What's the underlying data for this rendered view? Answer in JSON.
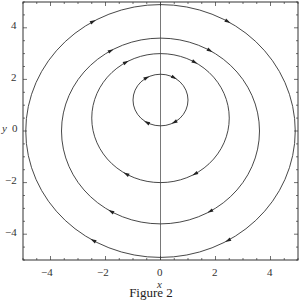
{
  "chart_data": {
    "type": "line",
    "title": "",
    "caption": "Figure 2",
    "xlabel": "x",
    "ylabel": "y",
    "xlim": [
      -5,
      5
    ],
    "ylim": [
      -5,
      5
    ],
    "grid": false,
    "x_ticks": [
      -4,
      -2,
      0,
      2,
      4
    ],
    "y_ticks": [
      -4,
      -2,
      0,
      2,
      4
    ],
    "x_tick_labels": [
      "−4",
      "−2",
      "0",
      "2",
      "4"
    ],
    "y_tick_labels": [
      "−4",
      "−2",
      "0",
      "2",
      "4"
    ],
    "axis_line": "vertical line at x = 0",
    "series": [
      {
        "name": "orbit r=1",
        "shape": "circle",
        "center": [
          0,
          1.2
        ],
        "radius": 1.0,
        "direction": "clockwise"
      },
      {
        "name": "orbit r=2",
        "shape": "circle",
        "center": [
          0,
          0.5
        ],
        "radius": 2.5,
        "direction": "clockwise"
      },
      {
        "name": "orbit r=3",
        "shape": "circle",
        "center": [
          0,
          0
        ],
        "radius": 3.6,
        "direction": "clockwise"
      },
      {
        "name": "orbit r=4",
        "shape": "circle",
        "center": [
          0,
          0
        ],
        "radius": 4.9,
        "direction": "clockwise"
      }
    ]
  },
  "labels": {
    "x_axis": "x",
    "y_axis": "y",
    "caption": "Figure 2",
    "xt": [
      "−4",
      "−2",
      "0",
      "2",
      "4"
    ],
    "yt": [
      "4",
      "2",
      "0",
      "−2",
      "−4"
    ]
  }
}
